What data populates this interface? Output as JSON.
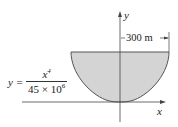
{
  "diagram": {
    "type": "parabolic-quartic basin cross-section",
    "x_axis_label": "x",
    "y_axis_label": "y",
    "dimension_label": "300 m",
    "equation": {
      "lhs": "y =",
      "numerator_base": "x",
      "numerator_exp": "4",
      "denominator_base": "45 × 10",
      "denominator_exp": "6"
    },
    "colors": {
      "fill": "#d4d4d4",
      "stroke": "#555555",
      "axis": "#444444",
      "text": "#222222"
    }
  }
}
